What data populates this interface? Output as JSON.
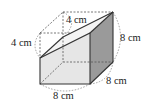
{
  "diagram": {
    "type": "3d-solid",
    "labels": {
      "top_depth": "4 cm",
      "left_height_cut": "4 cm",
      "right_height": "8 cm",
      "depth": "8 cm",
      "width": "8 cm"
    },
    "colors": {
      "front_face": "#e6e6e6",
      "top_face": "#f4f4f4",
      "right_face": "#9a9a9a",
      "edge": "#333333",
      "dashed": "#555555"
    }
  }
}
